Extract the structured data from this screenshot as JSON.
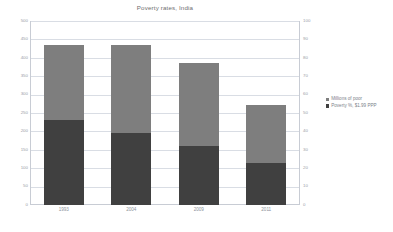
{
  "chart_data": {
    "type": "bar",
    "subtype": "stacked-bar-dual-axis",
    "title": "Poverty rates, India",
    "subtitle": "",
    "xlabel": "",
    "ylabel": "",
    "categories": [
      "1993",
      "2004",
      "2009",
      "2011"
    ],
    "series": [
      {
        "name": "Poverty %, $1.99 PPP",
        "axis": "right",
        "color": "#404040",
        "values": [
          45,
          38,
          31,
          21
        ]
      },
      {
        "name": "Millions of poor",
        "axis": "left",
        "color": "#7e7e7e",
        "values": [
          435,
          435,
          385,
          273
        ]
      }
    ],
    "left_axis": {
      "label": "Millions of poor",
      "ylim": [
        0,
        500
      ],
      "tick_step": 50,
      "ticks": [
        "500",
        "450",
        "400",
        "350",
        "300",
        "250",
        "200",
        "150",
        "100",
        "50",
        "0"
      ]
    },
    "right_axis": {
      "label": "Poverty %, $1.99 PPP",
      "ylim": [
        0,
        100
      ],
      "tick_step": 10,
      "ticks": [
        "100",
        "90",
        "80",
        "70",
        "60",
        "50",
        "40",
        "30",
        "20",
        "10",
        "0"
      ]
    },
    "grid": true,
    "legend_position": "right",
    "legend": [
      {
        "label": "Millions of poor",
        "color": "#7e7e7e"
      },
      {
        "label": "Poverty %, $1.99 PPP",
        "color": "#404040"
      }
    ],
    "bars": [
      {
        "category": "1993",
        "lower_value": 230,
        "upper_top": 435
      },
      {
        "category": "2004",
        "lower_value": 195,
        "upper_top": 435
      },
      {
        "category": "2009",
        "lower_value": 160,
        "upper_top": 385
      },
      {
        "category": "2011",
        "lower_value": 113,
        "upper_top": 273
      }
    ]
  },
  "colors": {
    "upper_segment": "#7e7e7e",
    "lower_segment": "#404040",
    "grid": "#d9dde4",
    "axis": "#c8ccd4",
    "text": "#8d939b",
    "background": "#ffffff"
  }
}
